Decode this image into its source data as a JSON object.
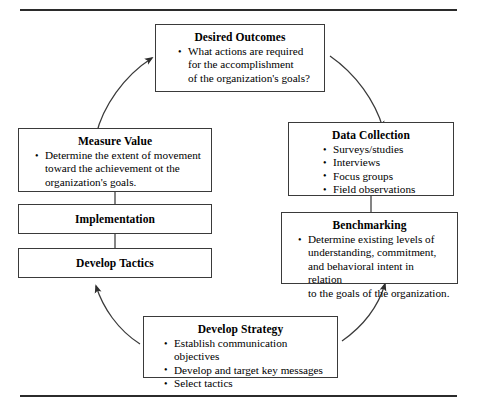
{
  "diagram": {
    "type": "cyclical-process",
    "frame": {
      "top_rule": true,
      "bottom_rule": true
    },
    "boxes": [
      {
        "id": "desired-outcomes",
        "title": "Desired Outcomes",
        "bullets": [
          [
            "What actions are required",
            "for the accomplishment",
            "of the organization's goals?"
          ]
        ]
      },
      {
        "id": "measure-value",
        "title": "Measure Value",
        "bullets": [
          [
            "Determine the extent of movement",
            "toward the achievement ot the",
            "organization's goals."
          ]
        ]
      },
      {
        "id": "implementation",
        "title": "Implementation",
        "bullets": []
      },
      {
        "id": "develop-tactics",
        "title": "Develop Tactics",
        "bullets": []
      },
      {
        "id": "data-collection",
        "title": "Data Collection",
        "bullets": [
          [
            "Surveys/studies"
          ],
          [
            "Interviews"
          ],
          [
            "Focus groups"
          ],
          [
            "Field observations"
          ]
        ]
      },
      {
        "id": "benchmarking",
        "title": "Benchmarking",
        "bullets": [
          [
            "Determine existing levels of",
            "understanding, commitment,",
            "and behavioral intent in relation",
            "to the goals of the organization."
          ]
        ]
      },
      {
        "id": "develop-strategy",
        "title": "Develop Strategy",
        "bullets": [
          [
            "Establish communication objectives"
          ],
          [
            "Develop and target key messages"
          ],
          [
            "Select tactics"
          ]
        ]
      }
    ],
    "connectors": [
      {
        "id": "arc-measure-to-desired",
        "from": "measure-value",
        "to": "desired-outcomes",
        "arrow": "up-right"
      },
      {
        "id": "arc-desired-to-data",
        "from": "desired-outcomes",
        "to": "data-collection",
        "arrow": "down-right"
      },
      {
        "id": "arc-strategy-to-bench",
        "from": "develop-strategy",
        "to": "benchmarking",
        "arrow": "up-right"
      },
      {
        "id": "arc-strategy-to-tactics",
        "from": "develop-strategy",
        "to": "develop-tactics",
        "arrow": "up-left"
      },
      {
        "id": "link-data-to-bench",
        "from": "data-collection",
        "to": "benchmarking",
        "arrow": "none"
      },
      {
        "id": "link-measure-to-impl",
        "from": "measure-value",
        "to": "implementation",
        "arrow": "none"
      },
      {
        "id": "link-impl-to-tactics",
        "from": "implementation",
        "to": "develop-tactics",
        "arrow": "none"
      }
    ],
    "colors": {
      "line": "#3a3a3a",
      "rule": "#2b2b2b",
      "text": "#000000",
      "background": "#ffffff"
    }
  }
}
